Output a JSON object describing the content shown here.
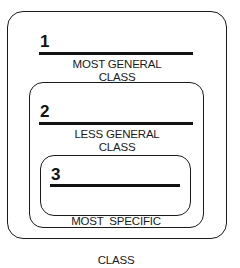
{
  "diagram": {
    "type": "nested-class-hierarchy",
    "classes": [
      {
        "number": "1",
        "line1": "MOST GENERAL",
        "line2": "CLASS"
      },
      {
        "number": "2",
        "line1": "LESS GENERAL",
        "line2": "CLASS"
      },
      {
        "number": "3",
        "line1": "MOST  SPECIFIC",
        "line2": "CLASS"
      }
    ],
    "colors": {
      "stroke": "#1a1a1a",
      "background": "#ffffff"
    }
  }
}
